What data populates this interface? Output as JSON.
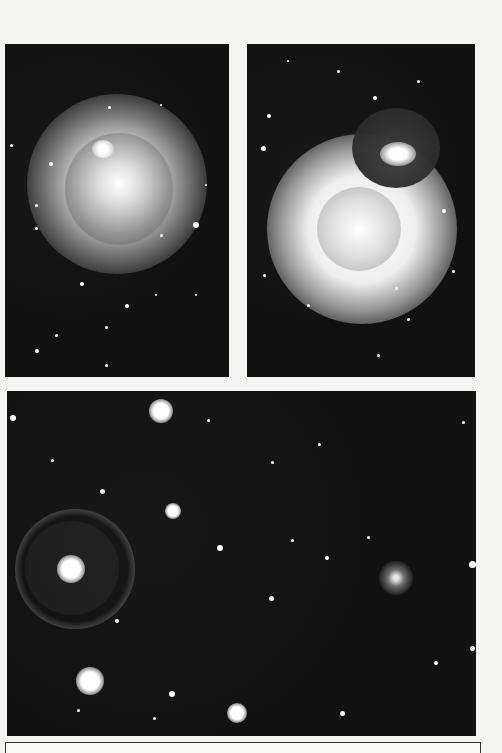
{
  "figure": {
    "panels": [
      {
        "id": "top-left",
        "description": "Bright star with circular halo and dark occulting disk, secondary bright knot at upper-left of disk",
        "box": {
          "x": 5,
          "y": 44,
          "w": 224,
          "h": 333
        }
      },
      {
        "id": "top-right",
        "description": "Bright star halo with inner disk and overlapping dark circular region containing a bright elongated object",
        "box": {
          "x": 247,
          "y": 44,
          "w": 228,
          "h": 333
        }
      },
      {
        "id": "bottom",
        "description": "Wide star field with a bright star inside a dark ring at left and a small spiral galaxy at right",
        "box": {
          "x": 7,
          "y": 391,
          "w": 469,
          "h": 345
        }
      }
    ],
    "colors": {
      "page_background": "#f4f4f2",
      "sky": "#111111",
      "star": "#ffffff"
    }
  }
}
